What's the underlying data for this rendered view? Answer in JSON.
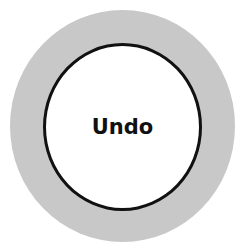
{
  "undo_button": {
    "label": "Undo",
    "ring_color": "#c8c8c8",
    "fill_color": "#ffffff",
    "border_color": "#111111"
  }
}
